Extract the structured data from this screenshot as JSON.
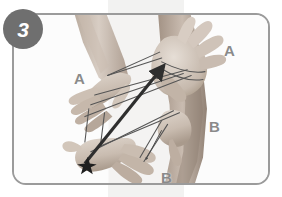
{
  "illustration": {
    "step_badge": "3",
    "alt_description": "Two pairs of hands holding a cat's cradle string figure; a thick arrow points from the lower-left hand up toward the upper-right hand.",
    "labels": [
      {
        "id": "a-upper-left",
        "text": "A"
      },
      {
        "id": "a-upper-right",
        "text": "A"
      },
      {
        "id": "b-middle-right",
        "text": "B"
      },
      {
        "id": "b-lower",
        "text": "B"
      }
    ],
    "colors": {
      "badge_fill": "#6f6f6f",
      "badge_text": "#ffffff",
      "frame_border": "#9b9b9b",
      "frame_background": "#fcfcfc",
      "label_text": "#8a8a8a",
      "band_background": "#f2f2f1",
      "string_line": "#555555",
      "arrow": "#2e2e2e",
      "skin_light": "#d9cfc6",
      "skin_mid": "#c0b2a6",
      "skin_dark": "#9d8d80"
    },
    "annotations": {
      "arrow_direction": "lower-left to upper-right",
      "arrow_start_marker": "star-burst",
      "arrow_end_marker": "arrowhead"
    }
  }
}
